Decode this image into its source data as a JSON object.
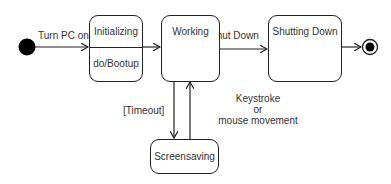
{
  "diagram": {
    "type": "state-machine",
    "states": [
      {
        "id": "initializing",
        "name": "Initializing",
        "activity": "do/Bootup"
      },
      {
        "id": "working",
        "name": "Working"
      },
      {
        "id": "shutting_down",
        "name": "Shutting Down"
      },
      {
        "id": "screensaving",
        "name": "Screensaving"
      }
    ],
    "transitions": [
      {
        "from": "initial",
        "to": "initializing",
        "label": "Turn PC on"
      },
      {
        "from": "initializing",
        "to": "working",
        "label": ""
      },
      {
        "from": "working",
        "to": "shutting_down",
        "label": "Shut Down"
      },
      {
        "from": "shutting_down",
        "to": "final",
        "label": ""
      },
      {
        "from": "working",
        "to": "screensaving",
        "label": "[Timeout]"
      },
      {
        "from": "screensaving",
        "to": "working",
        "label_lines": [
          "Keystroke",
          "or",
          "mouse movement"
        ]
      }
    ]
  }
}
